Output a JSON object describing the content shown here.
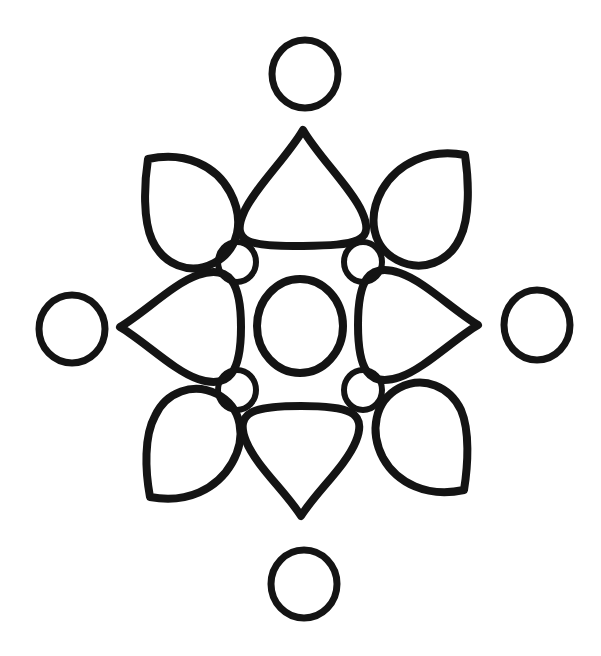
{
  "document": {
    "kind": "coloring-page-line-art",
    "title": "Mandala Flower Line Art",
    "background_color": "#ffffff",
    "ink_color": "#141414",
    "width": 601,
    "height": 656,
    "center_x": 300,
    "center_y": 328
  },
  "artwork": {
    "description": "Hand-drawn symmetric mandala: a central circle ringed by four small circles, four teardrop petals on the cardinal axes, four pointed leaves on the diagonals, and four outer circles.",
    "element_count": 17,
    "symmetry": "4-fold radial",
    "stroke_widths": {
      "large": 8,
      "medium": 7,
      "small": 6
    },
    "center_circle": {
      "name": "center-circle",
      "cx": 300,
      "cy": 326,
      "rx": 43,
      "ry": 47,
      "stroke": 8
    },
    "inner_small_circles": [
      {
        "name": "small-circle-top-left",
        "cx": 237,
        "cy": 262,
        "rx": 19,
        "ry": 20,
        "stroke": 6
      },
      {
        "name": "small-circle-top-right",
        "cx": 363,
        "cy": 262,
        "rx": 19,
        "ry": 20,
        "stroke": 6
      },
      {
        "name": "small-circle-bottom-left",
        "cx": 237,
        "cy": 390,
        "rx": 19,
        "ry": 20,
        "stroke": 6
      },
      {
        "name": "small-circle-bottom-right",
        "cx": 363,
        "cy": 390,
        "rx": 19,
        "ry": 20,
        "stroke": 6
      }
    ],
    "cardinal_petals": [
      {
        "name": "petal-top",
        "direction": "up",
        "tip_x": 303,
        "tip_y": 130,
        "base_y": 246,
        "half_width": 62,
        "stroke": 8
      },
      {
        "name": "petal-bottom",
        "direction": "down",
        "tip_x": 301,
        "tip_y": 516,
        "base_y": 406,
        "half_width": 59,
        "stroke": 8
      },
      {
        "name": "petal-left",
        "direction": "left",
        "tip_x": 120,
        "tip_y": 327,
        "base_x": 240,
        "half_width": 56,
        "stroke": 8
      },
      {
        "name": "petal-right",
        "direction": "right",
        "tip_x": 478,
        "tip_y": 325,
        "base_x": 362,
        "half_width": 56,
        "stroke": 8
      }
    ],
    "diagonal_leaves": [
      {
        "name": "leaf-top-left",
        "corner": "top-left",
        "corner_x": 148,
        "corner_y": 159,
        "stroke": 8
      },
      {
        "name": "leaf-top-right",
        "corner": "top-right",
        "corner_x": 465,
        "corner_y": 155,
        "stroke": 8
      },
      {
        "name": "leaf-bottom-left",
        "corner": "bottom-left",
        "corner_x": 150,
        "corner_y": 497,
        "stroke": 8
      },
      {
        "name": "leaf-bottom-right",
        "corner": "bottom-right",
        "corner_x": 464,
        "corner_y": 490,
        "stroke": 8
      }
    ],
    "outer_circles": [
      {
        "name": "outer-circle-top",
        "cx": 305,
        "cy": 74,
        "rx": 33,
        "ry": 34,
        "stroke": 7
      },
      {
        "name": "outer-circle-bottom",
        "cx": 304,
        "cy": 584,
        "rx": 33,
        "ry": 34,
        "stroke": 7
      },
      {
        "name": "outer-circle-left",
        "cx": 72,
        "cy": 329,
        "rx": 33,
        "ry": 34,
        "stroke": 7
      },
      {
        "name": "outer-circle-right",
        "cx": 537,
        "cy": 325,
        "rx": 33,
        "ry": 35,
        "stroke": 7
      }
    ]
  }
}
